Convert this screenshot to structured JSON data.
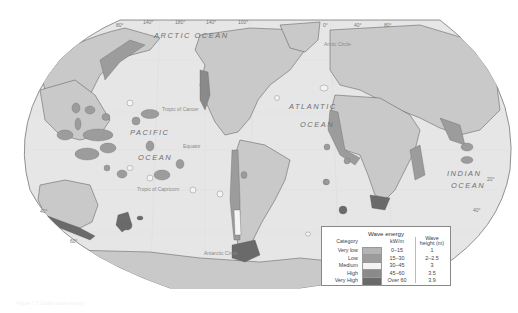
{
  "map": {
    "title": "Global wave energy distribution",
    "projection": "Robinson-like world map",
    "colors": {
      "ocean": "#e6e6e6",
      "land": "#c9c9c9",
      "border": "#555555",
      "very_low": "#b4b4b4",
      "low": "#9c9c9c",
      "medium": "#f4f4f4",
      "high": "#8a8a8a",
      "very_high": "#6a6a6a"
    },
    "ocean_labels": {
      "arctic": "ARCTIC OCEAN",
      "pacific_1": "PACIFIC",
      "pacific_2": "OCEAN",
      "atlantic_1": "ATLANTIC",
      "atlantic_2": "OCEAN",
      "indian_1": "INDIAN",
      "indian_2": "OCEAN"
    },
    "line_labels": {
      "arctic_circle": "Arctic Circle",
      "tropic_cancer": "Tropic of Cancer",
      "equator": "Equator",
      "tropic_capricorn": "Tropic of Capricorn",
      "antarctic_circle": "Antarctic Circle"
    },
    "graticule_labels": {
      "top": [
        "80°",
        "140°",
        "180°",
        "140°",
        "100°",
        "0°",
        "40°",
        "80°"
      ],
      "left": [
        "40°",
        "60°"
      ],
      "right": [
        "20°",
        "40°"
      ]
    }
  },
  "legend": {
    "title": "Wave energy",
    "header_category": "Category",
    "header_kw": "kW/m",
    "header_height_1": "Wave",
    "header_height_2": "height (m)",
    "rows": [
      {
        "category": "Very low",
        "kw": "0–15",
        "height": "1",
        "color": "#b4b4b4"
      },
      {
        "category": "Low",
        "kw": "15–30",
        "height": "2–2.5",
        "color": "#9c9c9c"
      },
      {
        "category": "Medium",
        "kw": "30–45",
        "height": "3",
        "color": "#f4f4f4"
      },
      {
        "category": "High",
        "kw": "45–60",
        "height": "3.5",
        "color": "#8a8a8a"
      },
      {
        "category": "Very High",
        "kw": "Over 60",
        "height": "3.9",
        "color": "#6a6a6a"
      }
    ]
  },
  "caption": "Figure 7.7 Global wave energy"
}
